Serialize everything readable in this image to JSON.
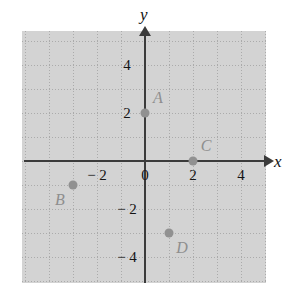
{
  "chart_data": {
    "type": "scatter",
    "title": "",
    "xlabel": "x",
    "ylabel": "y",
    "xlim": [
      -5,
      5
    ],
    "ylim": [
      -5,
      5
    ],
    "grid": true,
    "legend": "none",
    "x_ticks": [
      {
        "value": -2,
        "label": "− 2"
      },
      {
        "value": 0,
        "label": "0"
      },
      {
        "value": 2,
        "label": "2"
      },
      {
        "value": 4,
        "label": "4"
      }
    ],
    "y_ticks": [
      {
        "value": 4,
        "label": "4"
      },
      {
        "value": 2,
        "label": "2"
      },
      {
        "value": -2,
        "label": "− 2"
      },
      {
        "value": -4,
        "label": "− 4"
      }
    ],
    "points": [
      {
        "label": "A",
        "x": 0,
        "y": 2,
        "label_pos": "up-right"
      },
      {
        "label": "B",
        "x": -3,
        "y": -1,
        "label_pos": "down-left"
      },
      {
        "label": "C",
        "x": 2,
        "y": 0,
        "label_pos": "up-right"
      },
      {
        "label": "D",
        "x": 1,
        "y": -3,
        "label_pos": "down-right"
      }
    ],
    "point_color": "#919191",
    "axis_color": "#3b3b3b",
    "grid_color": "#b9b9b9"
  }
}
